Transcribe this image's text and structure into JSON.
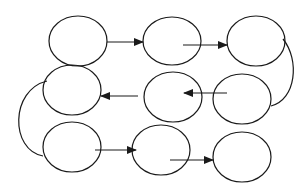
{
  "diagram": {
    "type": "flow",
    "stroke_color": "#1a1a1a",
    "background": "#ffffff",
    "nodes": [
      {
        "id": "n1",
        "cx": 78,
        "cy": 41,
        "rx": 29,
        "ry": 25
      },
      {
        "id": "n2",
        "cx": 172,
        "cy": 41,
        "rx": 29,
        "ry": 24
      },
      {
        "id": "n3",
        "cx": 256,
        "cy": 41,
        "rx": 29,
        "ry": 25
      },
      {
        "id": "n4",
        "cx": 72,
        "cy": 90,
        "rx": 29,
        "ry": 25
      },
      {
        "id": "n5",
        "cx": 173,
        "cy": 97,
        "rx": 29,
        "ry": 25
      },
      {
        "id": "n6",
        "cx": 242,
        "cy": 99,
        "rx": 29,
        "ry": 25
      },
      {
        "id": "n7",
        "cx": 72,
        "cy": 147,
        "rx": 29,
        "ry": 25
      },
      {
        "id": "n8",
        "cx": 161,
        "cy": 150,
        "rx": 29,
        "ry": 25
      },
      {
        "id": "n9",
        "cx": 242,
        "cy": 157,
        "rx": 29,
        "ry": 25
      }
    ],
    "arrows": [
      {
        "id": "a1",
        "from": "n1",
        "to": "n2",
        "x1": 107,
        "y1": 42,
        "x2": 143,
        "y2": 42,
        "head": true
      },
      {
        "id": "a2",
        "from": "n2",
        "to": "n3",
        "x1": 183,
        "y1": 45,
        "x2": 227,
        "y2": 45,
        "head": true
      },
      {
        "id": "a3",
        "from": "n5",
        "to": "n4",
        "x1": 138,
        "y1": 96,
        "x2": 101,
        "y2": 96,
        "head": true
      },
      {
        "id": "a4",
        "from": "n6",
        "to": "n5",
        "x1": 227,
        "y1": 93,
        "x2": 184,
        "y2": 93,
        "head": true
      },
      {
        "id": "a5",
        "from": "n7",
        "to": "n8",
        "x1": 95,
        "y1": 150,
        "x2": 136,
        "y2": 150,
        "head": true
      },
      {
        "id": "a6",
        "from": "n8",
        "to": "n9",
        "x1": 170,
        "y1": 160,
        "x2": 213,
        "y2": 160,
        "head": true
      }
    ],
    "connectors": [
      {
        "id": "c1",
        "from": "n3",
        "to": "n6",
        "path": "M283 39 C 300 60, 296 100, 271 106"
      },
      {
        "id": "c2",
        "from": "n4",
        "to": "n7",
        "path": "M47 81 C 10 90, 10 150, 43 156"
      }
    ]
  }
}
